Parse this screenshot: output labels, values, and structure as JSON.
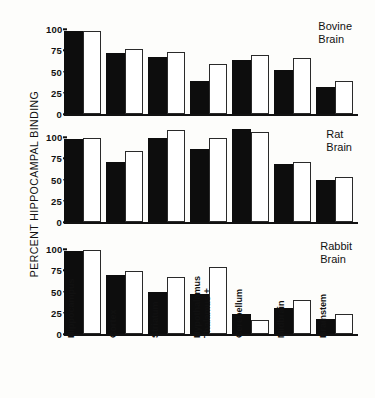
{
  "chart_data": {
    "type": "bar",
    "title": "",
    "ylabel": "PERCENT HIPPOCAMPAL BINDING",
    "xlabel": "",
    "ylim": [
      0,
      115
    ],
    "yticks": [
      0,
      25,
      50,
      75,
      100
    ],
    "ytick_labels": [
      "0",
      "25",
      "50",
      "75",
      "100"
    ],
    "grid": false,
    "legend": "none",
    "categories": [
      "Hippocampus",
      "Cortex",
      "Striatum",
      "Thalamus + Hypothalamus",
      "Cerebellum",
      "Midbrain",
      "Brainstem"
    ],
    "panels": [
      {
        "title_line1": "Bovine",
        "title_line2": "Brain",
        "series": [
          {
            "name": "filled",
            "values": [
              100,
              73,
              68,
              40,
              65,
              53,
              33
            ]
          },
          {
            "name": "open",
            "values": [
              100,
              78,
              74,
              60,
              71,
              67,
              40
            ]
          }
        ]
      },
      {
        "title_line1": "Rat",
        "title_line2": "Brain",
        "series": [
          {
            "name": "filled",
            "values": [
              100,
              72,
              101,
              88,
              112,
              70,
              51
            ]
          },
          {
            "name": "open",
            "values": [
              101,
              85,
              110,
              101,
              108,
              72,
              54
            ]
          }
        ]
      },
      {
        "title_line1": "Rabbit",
        "title_line2": "Brain",
        "series": [
          {
            "name": "filled",
            "values": [
              100,
              71,
              51,
              48,
              24,
              31,
              18
            ]
          },
          {
            "name": "open",
            "values": [
              101,
              76,
              69,
              80,
              17,
              41,
              24
            ]
          }
        ]
      }
    ]
  }
}
